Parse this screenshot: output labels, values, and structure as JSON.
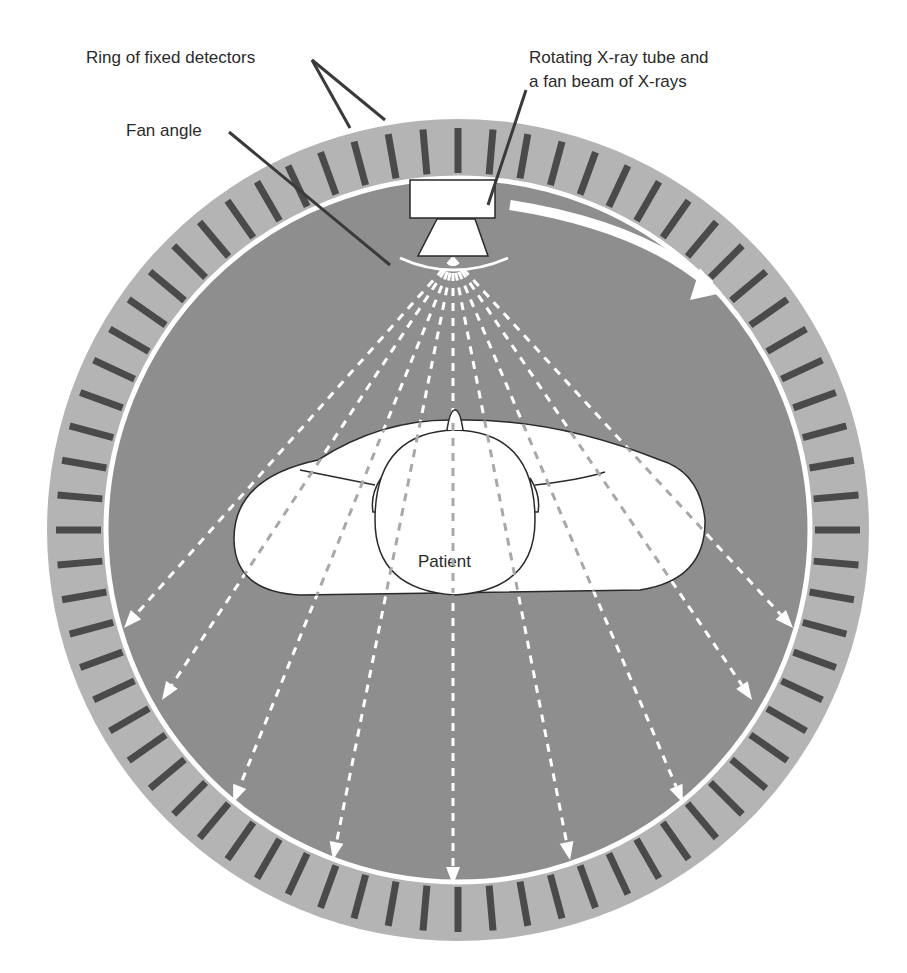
{
  "diagram": {
    "type": "CT scanner fan-beam geometry (third/fourth generation)",
    "labels": {
      "ring_of_detectors": "Ring of fixed detectors",
      "xray_tube_line1": "Rotating X-ray tube and",
      "xray_tube_line2": "a fan beam of X-rays",
      "fan_angle": "Fan angle",
      "patient": "Patient"
    },
    "colors": {
      "background": "#ffffff",
      "detector_ring": "#b4b4b4",
      "detector_element": "#4a4a4a",
      "gantry_interior": "#8e8e8e",
      "white_elements": "#ffffff",
      "outline": "#2a2a2a"
    },
    "geometry": {
      "center": [
        458,
        530
      ],
      "outer_radius": 412,
      "inner_ring_radius": 352,
      "detector_count": 72,
      "beam_count": 11
    }
  }
}
